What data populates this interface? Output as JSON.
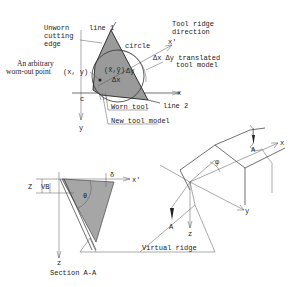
{
  "top_view": {
    "labels": {
      "unworn_edge": [
        "Unworn",
        "cutting",
        "edge"
      ],
      "line1": "line 1",
      "circle": "circle",
      "tool_ridge": [
        "Tool ridge",
        "direction"
      ],
      "x_prime": "x'",
      "translated": [
        "Δx Δy translated",
        "tool model"
      ],
      "arbitrary_point": [
        "An arbitrary",
        "worn-out point"
      ],
      "xy": "(x, y)",
      "center": "(x̃,ỹ)",
      "delta_y": "Δy",
      "delta_x": "Δx",
      "origin": "c",
      "x_axis": "x",
      "y_axis": "y",
      "line2": "line 2",
      "worn_tool": "Worn tool",
      "new_tool": "New tool model"
    }
  },
  "section_view": {
    "labels": {
      "z_left": "Z",
      "vb": "VB",
      "delta": "δ",
      "x_prime": "x'",
      "theta": "θ",
      "z_axis": "z",
      "title": "Section A-A"
    }
  },
  "iso_view": {
    "labels": {
      "a_top": "A",
      "a_bottom": "A",
      "x": "x",
      "y": "y",
      "z": "z",
      "phi": "φ",
      "virtual_ridge": "Virtual ridge"
    }
  },
  "colors": {
    "tool_fill": "#9a9a9a",
    "line": "#333333",
    "background": "#ffffff"
  }
}
